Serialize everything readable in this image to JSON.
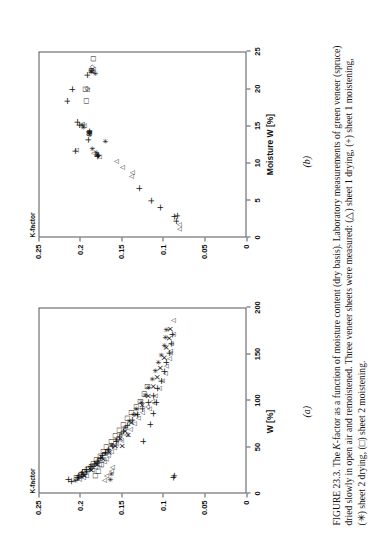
{
  "figure": {
    "label_prefix": "FIGURE",
    "number": "23.3.",
    "caption_segments": [
      "The ",
      "K",
      "-factor as a function of moisture content (dry basis). Laboratory measurements of green veneer (spruce) dried slowly in open air and remoistened. Three veneer sheets were measured: (△) sheet 1 drying, (+) sheet 1 moistening, (✳) sheet 2 drying, (□) sheet 2 moistening."
    ],
    "caption_full": "FIGURE 23.3. The K-factor as a function of moisture content (dry basis). Laboratory measurements of green veneer (spruce) dried slowly in open air and remoistened. Three veneer sheets were measured: (△) sheet 1 drying, (+) sheet 1 moistening, (✳) sheet 2 drying, (□) sheet 2 moistening.",
    "sub_label_a": "(a)",
    "sub_label_b": "(b)"
  },
  "legend_markers": [
    {
      "symbol": "△",
      "name": "triangle",
      "meaning": "sheet 1 drying"
    },
    {
      "symbol": "+",
      "name": "plus",
      "meaning": "sheet 1 moistening"
    },
    {
      "symbol": "✳",
      "name": "asterisk",
      "meaning": "sheet 2 drying"
    },
    {
      "symbol": "□",
      "name": "square",
      "meaning": "sheet 2 moistening"
    }
  ],
  "chart_data": [
    {
      "id": "panel_a",
      "type": "scatter",
      "title": "",
      "sub_label": "(a)",
      "xlabel": "W [%]",
      "ylabel": "K-factor",
      "xlim": [
        0,
        200
      ],
      "ylim": [
        0,
        0.25
      ],
      "xticks": [
        0,
        50,
        100,
        150,
        200
      ],
      "xticklabels": [
        "0",
        "50",
        "100",
        "150",
        "200"
      ],
      "yticks": [
        0,
        0.05,
        0.1,
        0.15,
        0.2,
        0.25
      ],
      "yticklabels": [
        "0",
        "0.05",
        "0.1",
        "0.15",
        "0.2",
        "0.25"
      ],
      "grid": false,
      "legend_position": "none",
      "series": [
        {
          "name": "sheet 1 drying",
          "marker": "triangle",
          "symbol": "△",
          "points": [
            [
              14,
              0.202
            ],
            [
              16,
              0.197
            ],
            [
              18,
              0.193
            ],
            [
              21,
              0.196
            ],
            [
              24,
              0.186
            ],
            [
              27,
              0.183
            ],
            [
              30,
              0.178
            ],
            [
              33,
              0.172
            ],
            [
              36,
              0.17
            ],
            [
              40,
              0.167
            ],
            [
              44,
              0.163
            ],
            [
              48,
              0.16
            ],
            [
              52,
              0.158
            ],
            [
              56,
              0.152
            ],
            [
              62,
              0.146
            ],
            [
              68,
              0.141
            ],
            [
              74,
              0.136
            ],
            [
              80,
              0.131
            ],
            [
              86,
              0.126
            ],
            [
              92,
              0.12
            ],
            [
              98,
              0.114
            ],
            [
              104,
              0.11
            ],
            [
              112,
              0.106
            ],
            [
              120,
              0.102
            ],
            [
              128,
              0.099
            ],
            [
              136,
              0.097
            ],
            [
              144,
              0.094
            ],
            [
              152,
              0.092
            ],
            [
              160,
              0.091
            ],
            [
              170,
              0.089
            ],
            [
              185,
              0.089
            ],
            [
              13,
              0.172
            ],
            [
              18,
              0.17
            ],
            [
              23,
              0.163
            ],
            [
              27,
              0.162
            ],
            [
              90,
              0.118
            ],
            [
              96,
              0.112
            ],
            [
              150,
              0.092
            ]
          ]
        },
        {
          "name": "sheet 1 moistening",
          "marker": "plus",
          "symbol": "+",
          "points": [
            [
              12,
              0.213
            ],
            [
              14,
              0.216
            ],
            [
              16,
              0.206
            ],
            [
              18,
              0.204
            ],
            [
              20,
              0.201
            ],
            [
              22,
              0.199
            ],
            [
              25,
              0.195
            ],
            [
              28,
              0.19
            ],
            [
              31,
              0.185
            ],
            [
              34,
              0.181
            ],
            [
              37,
              0.178
            ],
            [
              40,
              0.175
            ],
            [
              43,
              0.172
            ],
            [
              46,
              0.168
            ],
            [
              50,
              0.164
            ],
            [
              55,
              0.159
            ],
            [
              60,
              0.155
            ],
            [
              66,
              0.15
            ],
            [
              72,
              0.145
            ],
            [
              78,
              0.139
            ],
            [
              84,
              0.133
            ],
            [
              90,
              0.127
            ],
            [
              97,
              0.12
            ],
            [
              104,
              0.114
            ],
            [
              112,
              0.109
            ],
            [
              120,
              0.105
            ],
            [
              130,
              0.101
            ],
            [
              140,
              0.098
            ],
            [
              150,
              0.095
            ],
            [
              160,
              0.093
            ],
            [
              170,
              0.091
            ],
            [
              55,
              0.126
            ],
            [
              73,
              0.118
            ],
            [
              85,
              0.114
            ],
            [
              97,
              0.11
            ],
            [
              16,
              0.09
            ],
            [
              18,
              0.089
            ]
          ]
        },
        {
          "name": "sheet 2 drying",
          "marker": "asterisk",
          "symbol": "✳",
          "points": [
            [
              13,
              0.207
            ],
            [
              15,
              0.203
            ],
            [
              17,
              0.2
            ],
            [
              19,
              0.197
            ],
            [
              22,
              0.193
            ],
            [
              25,
              0.189
            ],
            [
              28,
              0.186
            ],
            [
              31,
              0.182
            ],
            [
              34,
              0.179
            ],
            [
              38,
              0.175
            ],
            [
              42,
              0.171
            ],
            [
              46,
              0.167
            ],
            [
              51,
              0.163
            ],
            [
              57,
              0.157
            ],
            [
              63,
              0.152
            ],
            [
              70,
              0.147
            ],
            [
              77,
              0.142
            ],
            [
              84,
              0.137
            ],
            [
              90,
              0.133
            ],
            [
              97,
              0.128
            ],
            [
              105,
              0.123
            ],
            [
              113,
              0.119
            ],
            [
              122,
              0.114
            ],
            [
              131,
              0.11
            ],
            [
              140,
              0.107
            ],
            [
              148,
              0.103
            ],
            [
              158,
              0.1
            ],
            [
              167,
              0.098
            ],
            [
              175,
              0.097
            ],
            [
              14,
              0.165
            ],
            [
              20,
              0.163
            ]
          ]
        },
        {
          "name": "sheet 2 moistening",
          "marker": "square",
          "symbol": "□",
          "points": [
            [
              16,
              0.205
            ],
            [
              19,
              0.2
            ],
            [
              22,
              0.196
            ],
            [
              25,
              0.192
            ],
            [
              28,
              0.188
            ],
            [
              31,
              0.185
            ],
            [
              35,
              0.181
            ],
            [
              39,
              0.177
            ],
            [
              44,
              0.173
            ],
            [
              49,
              0.169
            ],
            [
              55,
              0.164
            ],
            [
              61,
              0.159
            ],
            [
              67,
              0.154
            ],
            [
              73,
              0.149
            ],
            [
              80,
              0.144
            ],
            [
              86,
              0.139
            ],
            [
              92,
              0.134
            ],
            [
              98,
              0.129
            ],
            [
              106,
              0.124
            ],
            [
              114,
              0.12
            ],
            [
              18,
              0.183
            ],
            [
              23,
              0.179
            ],
            [
              30,
              0.175
            ]
          ]
        },
        {
          "name": "additional measurement",
          "marker": "x",
          "symbol": "×",
          "points": [
            [
              18,
              0.196
            ],
            [
              24,
              0.188
            ],
            [
              30,
              0.18
            ],
            [
              36,
              0.173
            ],
            [
              43,
              0.166
            ],
            [
              50,
              0.159
            ],
            [
              58,
              0.153
            ],
            [
              66,
              0.147
            ],
            [
              75,
              0.14
            ],
            [
              84,
              0.133
            ],
            [
              94,
              0.126
            ],
            [
              104,
              0.119
            ],
            [
              114,
              0.113
            ],
            [
              124,
              0.108
            ],
            [
              134,
              0.104
            ],
            [
              145,
              0.1
            ],
            [
              156,
              0.097
            ],
            [
              166,
              0.094
            ],
            [
              176,
              0.092
            ],
            [
              50,
              0.15
            ],
            [
              62,
              0.143
            ]
          ]
        }
      ]
    },
    {
      "id": "panel_b",
      "type": "scatter",
      "title": "",
      "sub_label": "(b)",
      "xlabel": "Moisture W [%]",
      "ylabel": "K-factor",
      "xlim": [
        0,
        25
      ],
      "ylim": [
        0,
        0.25
      ],
      "xticks": [
        0,
        5,
        10,
        15,
        20,
        25
      ],
      "xticklabels": [
        "0",
        "5",
        "10",
        "15",
        "20",
        "25"
      ],
      "yticks": [
        0,
        0.05,
        0.1,
        0.15,
        0.2,
        0.25
      ],
      "yticklabels": [
        "0",
        "0.05",
        "0.1",
        "0.15",
        "0.2",
        "0.25"
      ],
      "grid": false,
      "legend_position": "none",
      "series": [
        {
          "name": "sheet 1 drying",
          "marker": "triangle",
          "symbol": "△",
          "points": [
            [
              1.0,
              0.082
            ],
            [
              1.6,
              0.082
            ],
            [
              8.1,
              0.139
            ],
            [
              8.6,
              0.138
            ],
            [
              9.3,
              0.15
            ],
            [
              10.1,
              0.158
            ],
            [
              10.7,
              0.178
            ],
            [
              10.9,
              0.182
            ],
            [
              11.2,
              0.185
            ],
            [
              11.6,
              0.205
            ],
            [
              13.7,
              0.191
            ],
            [
              14.0,
              0.19
            ],
            [
              14.9,
              0.196
            ],
            [
              15.1,
              0.198
            ],
            [
              19.7,
              0.192
            ],
            [
              22.2,
              0.186
            ],
            [
              22.5,
              0.185
            ]
          ]
        },
        {
          "name": "sheet 1 moistening",
          "marker": "plus",
          "symbol": "+",
          "points": [
            [
              2.1,
              0.086
            ],
            [
              2.7,
              0.089
            ],
            [
              2.8,
              0.085
            ],
            [
              3.9,
              0.106
            ],
            [
              4.8,
              0.117
            ],
            [
              6.5,
              0.131
            ],
            [
              10.8,
              0.182
            ],
            [
              10.9,
              0.18
            ],
            [
              11.5,
              0.208
            ],
            [
              13.0,
              0.192
            ],
            [
              14.1,
              0.191
            ],
            [
              15.0,
              0.203
            ],
            [
              15.4,
              0.205
            ],
            [
              18.2,
              0.217
            ],
            [
              19.8,
              0.212
            ],
            [
              21.7,
              0.193
            ]
          ]
        },
        {
          "name": "sheet 2 drying",
          "marker": "asterisk",
          "symbol": "✳",
          "points": [
            [
              11.0,
              0.18
            ],
            [
              11.3,
              0.181
            ],
            [
              11.8,
              0.186
            ],
            [
              12.8,
              0.171
            ],
            [
              13.8,
              0.19
            ],
            [
              14.0,
              0.19
            ],
            [
              14.7,
              0.197
            ],
            [
              15.0,
              0.198
            ],
            [
              21.9,
              0.183
            ],
            [
              22.1,
              0.188
            ],
            [
              22.3,
              0.187
            ]
          ]
        },
        {
          "name": "sheet 2 moistening",
          "marker": "square",
          "symbol": "□",
          "points": [
            [
              18.2,
              0.193
            ],
            [
              19.8,
              0.195
            ],
            [
              22.3,
              0.188
            ],
            [
              23.9,
              0.185
            ],
            [
              13.9,
              0.19
            ]
          ]
        },
        {
          "name": "additional measurement",
          "marker": "diamond",
          "symbol": "◇",
          "points": [
            [
              19.9,
              0.192
            ],
            [
              22.4,
              0.187
            ],
            [
              22.8,
              0.186
            ],
            [
              14.0,
              0.19
            ]
          ]
        }
      ]
    }
  ]
}
